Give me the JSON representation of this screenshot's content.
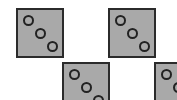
{
  "scene": {
    "background": "#ffffff",
    "tile_fill": "#a9a9a9",
    "tile_border": "#2b2b2b",
    "pip_outline": "#222222"
  },
  "tiles": [
    {
      "name": "tile-1",
      "pips": 3,
      "x": 16,
      "y": 8
    },
    {
      "name": "tile-2",
      "pips": 3,
      "x": 108,
      "y": 8
    },
    {
      "name": "tile-3",
      "pips": 3,
      "x": 62,
      "y": 62
    },
    {
      "name": "tile-4",
      "pips": 3,
      "x": 154,
      "y": 62
    }
  ]
}
